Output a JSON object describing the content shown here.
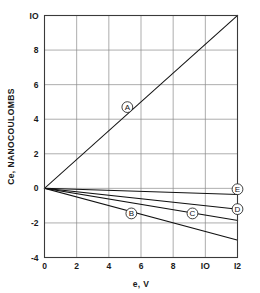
{
  "chart_data": {
    "type": "line",
    "title": "",
    "xlabel": "e, V",
    "ylabel": "Ce, NANOCOULOMBS",
    "xlim": [
      0,
      12
    ],
    "ylim": [
      -4,
      10
    ],
    "xticks": [
      0,
      2,
      4,
      6,
      8,
      10,
      12
    ],
    "xtick_labels": [
      "0",
      "2",
      "4",
      "6",
      "8",
      "IO",
      "I2"
    ],
    "yticks": [
      -4,
      -2,
      0,
      2,
      4,
      6,
      8,
      10
    ],
    "ytick_labels": [
      "-4",
      "-2",
      "0",
      "2",
      "4",
      "6",
      "8",
      "IO"
    ],
    "grid": true,
    "legend_position": "inline-callouts",
    "series": [
      {
        "name": "A",
        "label": "A",
        "label_x": 5.15,
        "label_y": 4.7,
        "x": [
          0,
          12
        ],
        "values": [
          0,
          10
        ]
      },
      {
        "name": "B",
        "label": "B",
        "label_x": 5.4,
        "label_y": -1.45,
        "x": [
          0,
          12
        ],
        "values": [
          0,
          -3.0
        ]
      },
      {
        "name": "C",
        "label": "C",
        "label_x": 9.2,
        "label_y": -1.45,
        "x": [
          0,
          12
        ],
        "values": [
          0,
          -1.85
        ]
      },
      {
        "name": "D",
        "label": "D",
        "label_x": 12.0,
        "label_y": -1.2,
        "x": [
          0,
          12
        ],
        "values": [
          0,
          -1.2
        ]
      },
      {
        "name": "E",
        "label": "E",
        "label_x": 12.0,
        "label_y": -0.05,
        "x": [
          0,
          12
        ],
        "values": [
          0,
          -0.35
        ]
      }
    ]
  },
  "figure": {
    "background": "#ffffff",
    "line_color": "#111111",
    "grid_color": "#8a8a8a",
    "frame_color": "#3a3a3a"
  }
}
